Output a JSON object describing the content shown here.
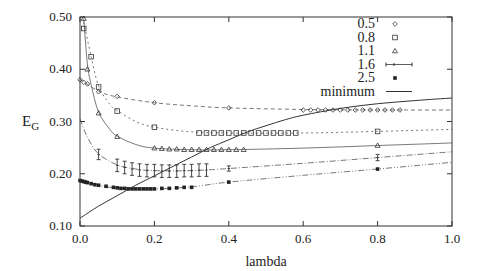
{
  "chart_data": {
    "type": "line",
    "title": "",
    "xlabel": "lambda",
    "ylabel": "E_G",
    "xlim": [
      0.0,
      1.0
    ],
    "ylim": [
      0.1,
      0.5
    ],
    "grid": false,
    "legend_position": "top-right",
    "x_ticks": [
      "0.0",
      "0.2",
      "0.4",
      "0.6",
      "0.8",
      "1.0"
    ],
    "y_ticks": [
      "0.10",
      "0.20",
      "0.30",
      "0.40",
      "0.50"
    ],
    "series": [
      {
        "name": "0.5",
        "marker": "diamond",
        "dash": "4,3",
        "points": [
          [
            0.0,
            0.38
          ],
          [
            0.01,
            0.375
          ],
          [
            0.02,
            0.372
          ],
          [
            0.05,
            0.357
          ],
          [
            0.1,
            0.348
          ],
          [
            0.2,
            0.336
          ],
          [
            0.4,
            0.326
          ],
          [
            0.6,
            0.322
          ],
          [
            0.62,
            0.322
          ],
          [
            0.64,
            0.322
          ],
          [
            0.66,
            0.322
          ],
          [
            0.68,
            0.322
          ],
          [
            0.7,
            0.322
          ],
          [
            0.72,
            0.322
          ],
          [
            0.74,
            0.322
          ],
          [
            0.76,
            0.322
          ],
          [
            0.78,
            0.322
          ],
          [
            0.8,
            0.322
          ],
          [
            0.82,
            0.322
          ],
          [
            0.84,
            0.322
          ],
          [
            0.86,
            0.322
          ]
        ],
        "curve": [
          [
            0.0,
            0.381
          ],
          [
            0.05,
            0.358
          ],
          [
            0.1,
            0.347
          ],
          [
            0.2,
            0.336
          ],
          [
            0.3,
            0.33
          ],
          [
            0.4,
            0.326
          ],
          [
            0.6,
            0.323
          ],
          [
            0.8,
            0.322
          ],
          [
            1.0,
            0.322
          ]
        ]
      },
      {
        "name": "0.8",
        "marker": "square",
        "dash": "2,3",
        "points": [
          [
            0.01,
            0.478
          ],
          [
            0.03,
            0.424
          ],
          [
            0.05,
            0.366
          ],
          [
            0.1,
            0.32
          ],
          [
            0.2,
            0.289
          ],
          [
            0.32,
            0.278
          ],
          [
            0.34,
            0.278
          ],
          [
            0.36,
            0.278
          ],
          [
            0.38,
            0.278
          ],
          [
            0.4,
            0.278
          ],
          [
            0.42,
            0.278
          ],
          [
            0.44,
            0.278
          ],
          [
            0.46,
            0.278
          ],
          [
            0.48,
            0.278
          ],
          [
            0.5,
            0.278
          ],
          [
            0.52,
            0.278
          ],
          [
            0.54,
            0.278
          ],
          [
            0.56,
            0.278
          ],
          [
            0.58,
            0.278
          ],
          [
            0.8,
            0.281
          ]
        ],
        "curve": [
          [
            0.01,
            0.49
          ],
          [
            0.03,
            0.424
          ],
          [
            0.05,
            0.368
          ],
          [
            0.08,
            0.333
          ],
          [
            0.1,
            0.321
          ],
          [
            0.15,
            0.3
          ],
          [
            0.2,
            0.289
          ],
          [
            0.3,
            0.28
          ],
          [
            0.4,
            0.278
          ],
          [
            0.6,
            0.278
          ],
          [
            0.8,
            0.281
          ],
          [
            1.0,
            0.285
          ]
        ]
      },
      {
        "name": "1.1",
        "marker": "triangle",
        "dash": "",
        "points": [
          [
            0.01,
            0.497
          ],
          [
            0.02,
            0.4
          ],
          [
            0.05,
            0.316
          ],
          [
            0.1,
            0.271
          ],
          [
            0.2,
            0.249
          ],
          [
            0.22,
            0.248
          ],
          [
            0.24,
            0.247
          ],
          [
            0.26,
            0.247
          ],
          [
            0.28,
            0.246
          ],
          [
            0.3,
            0.246
          ],
          [
            0.32,
            0.246
          ],
          [
            0.34,
            0.246
          ],
          [
            0.36,
            0.246
          ],
          [
            0.38,
            0.246
          ],
          [
            0.4,
            0.246
          ],
          [
            0.42,
            0.246
          ],
          [
            0.44,
            0.246
          ],
          [
            0.8,
            0.254
          ]
        ],
        "curve": [
          [
            0.01,
            0.497
          ],
          [
            0.02,
            0.41
          ],
          [
            0.03,
            0.37
          ],
          [
            0.05,
            0.318
          ],
          [
            0.08,
            0.285
          ],
          [
            0.1,
            0.272
          ],
          [
            0.15,
            0.256
          ],
          [
            0.2,
            0.249
          ],
          [
            0.3,
            0.246
          ],
          [
            0.4,
            0.246
          ],
          [
            0.6,
            0.249
          ],
          [
            0.8,
            0.254
          ],
          [
            1.0,
            0.259
          ]
        ]
      },
      {
        "name": "1.6",
        "marker": "errorbar",
        "dash": "6,2,1,2",
        "points": [
          [
            0.05,
            0.237,
            0.01
          ],
          [
            0.1,
            0.216,
            0.012
          ],
          [
            0.12,
            0.212,
            0.012
          ],
          [
            0.14,
            0.209,
            0.012
          ],
          [
            0.16,
            0.207,
            0.012
          ],
          [
            0.18,
            0.206,
            0.012
          ],
          [
            0.2,
            0.206,
            0.012
          ],
          [
            0.22,
            0.205,
            0.012
          ],
          [
            0.24,
            0.205,
            0.012
          ],
          [
            0.26,
            0.205,
            0.012
          ],
          [
            0.28,
            0.206,
            0.012
          ],
          [
            0.3,
            0.206,
            0.012
          ],
          [
            0.32,
            0.207,
            0.012
          ],
          [
            0.34,
            0.207,
            0.012
          ],
          [
            0.4,
            0.21,
            0.005
          ],
          [
            0.8,
            0.231,
            0.006
          ]
        ],
        "curve": [
          [
            0.0,
            0.305
          ],
          [
            0.02,
            0.27
          ],
          [
            0.05,
            0.238
          ],
          [
            0.1,
            0.217
          ],
          [
            0.15,
            0.209
          ],
          [
            0.2,
            0.206
          ],
          [
            0.3,
            0.206
          ],
          [
            0.4,
            0.21
          ],
          [
            0.6,
            0.22
          ],
          [
            0.8,
            0.231
          ],
          [
            1.0,
            0.242
          ]
        ]
      },
      {
        "name": "2.5",
        "marker": "star",
        "dash": "6,2,1,2,1,2",
        "points": [
          [
            0.0,
            0.187
          ],
          [
            0.005,
            0.186
          ],
          [
            0.01,
            0.185
          ],
          [
            0.015,
            0.184
          ],
          [
            0.02,
            0.183
          ],
          [
            0.03,
            0.181
          ],
          [
            0.04,
            0.179
          ],
          [
            0.05,
            0.178
          ],
          [
            0.07,
            0.176
          ],
          [
            0.09,
            0.174
          ],
          [
            0.1,
            0.173
          ],
          [
            0.11,
            0.172
          ],
          [
            0.12,
            0.172
          ],
          [
            0.13,
            0.171
          ],
          [
            0.14,
            0.171
          ],
          [
            0.15,
            0.171
          ],
          [
            0.16,
            0.171
          ],
          [
            0.17,
            0.171
          ],
          [
            0.18,
            0.171
          ],
          [
            0.19,
            0.171
          ],
          [
            0.2,
            0.171
          ],
          [
            0.22,
            0.172
          ],
          [
            0.24,
            0.172
          ],
          [
            0.26,
            0.173
          ],
          [
            0.28,
            0.174
          ],
          [
            0.3,
            0.174
          ],
          [
            0.4,
            0.184
          ],
          [
            0.8,
            0.209
          ]
        ],
        "curve": [
          [
            0.0,
            0.188
          ],
          [
            0.05,
            0.178
          ],
          [
            0.1,
            0.173
          ],
          [
            0.2,
            0.171
          ],
          [
            0.3,
            0.175
          ],
          [
            0.4,
            0.184
          ],
          [
            0.6,
            0.197
          ],
          [
            0.8,
            0.209
          ],
          [
            1.0,
            0.222
          ]
        ]
      },
      {
        "name": "minimum",
        "marker": "none",
        "dash": "",
        "curve": [
          [
            0.0,
            0.115
          ],
          [
            0.05,
            0.138
          ],
          [
            0.1,
            0.158
          ],
          [
            0.15,
            0.178
          ],
          [
            0.2,
            0.196
          ],
          [
            0.25,
            0.214
          ],
          [
            0.3,
            0.232
          ],
          [
            0.35,
            0.25
          ],
          [
            0.4,
            0.265
          ],
          [
            0.45,
            0.28
          ],
          [
            0.5,
            0.292
          ],
          [
            0.55,
            0.303
          ],
          [
            0.6,
            0.312
          ],
          [
            0.7,
            0.325
          ],
          [
            0.8,
            0.334
          ],
          [
            0.9,
            0.34
          ],
          [
            1.0,
            0.345
          ]
        ]
      }
    ]
  },
  "legend": {
    "entries": [
      "0.5",
      "0.8",
      "1.1",
      "1.6",
      "2.5",
      "minimum"
    ]
  },
  "axes": {
    "xlabel": "lambda",
    "ylabel_main": "E",
    "ylabel_sub": "G"
  }
}
